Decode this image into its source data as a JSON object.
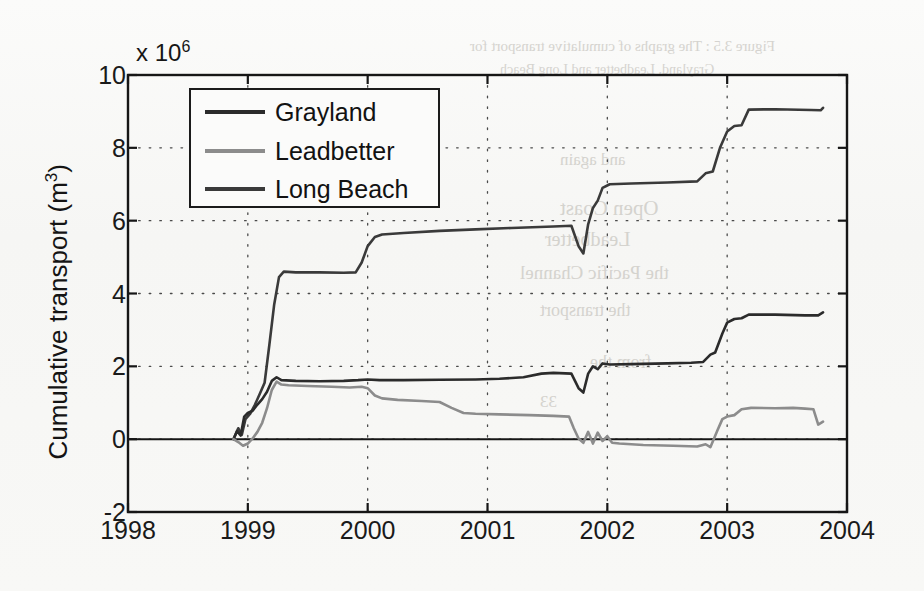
{
  "figure": {
    "exponent_label": "x 10",
    "exponent_sup": "6",
    "ylabel_text": "Cumulative transport (m",
    "ylabel_sup": "3",
    "ylabel_tail": ")"
  },
  "legend": {
    "items": [
      {
        "label": "Grayland",
        "color": "#2b2b2b"
      },
      {
        "label": "Leadbetter",
        "color": "#8c8c8c"
      },
      {
        "label": "Long Beach",
        "color": "#3a3a3a"
      }
    ]
  },
  "bleed_through": [
    {
      "text": "Figure 3.5 : The graphs of cumulative transport for",
      "x": 470,
      "y": 38,
      "size": 15
    },
    {
      "text": "Grayland, Leadbetter and Long Beach",
      "x": 500,
      "y": 62,
      "size": 14
    },
    {
      "text": "and again",
      "x": 560,
      "y": 150,
      "size": 17
    },
    {
      "text": "Open Coast",
      "x": 560,
      "y": 196,
      "size": 21
    },
    {
      "text": "Leadbetter",
      "x": 545,
      "y": 228,
      "size": 20
    },
    {
      "text": "the Pacific Channel",
      "x": 520,
      "y": 262,
      "size": 19
    },
    {
      "text": "the transport",
      "x": 540,
      "y": 300,
      "size": 18
    },
    {
      "text": "from the",
      "x": 590,
      "y": 352,
      "size": 18
    },
    {
      "text": "33",
      "x": 540,
      "y": 392,
      "size": 17
    }
  ],
  "chart_data": {
    "type": "line",
    "title": "",
    "xlabel": "",
    "ylabel": "Cumulative transport (m3)",
    "y_exponent": 1000000,
    "xlim": [
      1998,
      2004
    ],
    "ylim": [
      -2,
      10
    ],
    "xticks": [
      "1998",
      "1999",
      "2000",
      "2001",
      "2002",
      "2003",
      "2004"
    ],
    "yticks": [
      "10",
      "8",
      "6",
      "4",
      "2",
      "0",
      "-2"
    ],
    "grid": "dotted",
    "legend_position": "upper-left-inside",
    "units": "million cubic metres",
    "series": [
      {
        "name": "Long Beach",
        "color": "#3a3a3a",
        "points": [
          [
            1998.88,
            0.0
          ],
          [
            1998.92,
            0.3
          ],
          [
            1998.95,
            0.12
          ],
          [
            1998.98,
            0.55
          ],
          [
            1999.02,
            0.7
          ],
          [
            1999.06,
            0.95
          ],
          [
            1999.1,
            1.25
          ],
          [
            1999.14,
            1.55
          ],
          [
            1999.18,
            2.6
          ],
          [
            1999.22,
            3.7
          ],
          [
            1999.26,
            4.45
          ],
          [
            1999.3,
            4.6
          ],
          [
            1999.4,
            4.58
          ],
          [
            1999.6,
            4.58
          ],
          [
            1999.8,
            4.57
          ],
          [
            1999.9,
            4.58
          ],
          [
            1999.95,
            4.85
          ],
          [
            2000.0,
            5.3
          ],
          [
            2000.06,
            5.55
          ],
          [
            2000.12,
            5.62
          ],
          [
            2000.3,
            5.66
          ],
          [
            2000.6,
            5.72
          ],
          [
            2000.9,
            5.76
          ],
          [
            2001.2,
            5.8
          ],
          [
            2001.55,
            5.84
          ],
          [
            2001.7,
            5.86
          ],
          [
            2001.76,
            5.3
          ],
          [
            2001.8,
            5.1
          ],
          [
            2001.84,
            5.9
          ],
          [
            2001.88,
            6.35
          ],
          [
            2001.92,
            6.55
          ],
          [
            2001.96,
            6.9
          ],
          [
            2002.02,
            7.0
          ],
          [
            2002.2,
            7.02
          ],
          [
            2002.5,
            7.05
          ],
          [
            2002.75,
            7.08
          ],
          [
            2002.82,
            7.3
          ],
          [
            2002.88,
            7.35
          ],
          [
            2002.94,
            8.0
          ],
          [
            2003.0,
            8.45
          ],
          [
            2003.06,
            8.6
          ],
          [
            2003.12,
            8.62
          ],
          [
            2003.18,
            9.05
          ],
          [
            2003.4,
            9.06
          ],
          [
            2003.7,
            9.04
          ],
          [
            2003.78,
            9.03
          ],
          [
            2003.8,
            9.1
          ]
        ]
      },
      {
        "name": "Grayland",
        "color": "#2b2b2b",
        "points": [
          [
            1998.88,
            0.0
          ],
          [
            1998.91,
            0.22
          ],
          [
            1998.94,
            0.1
          ],
          [
            1998.97,
            0.62
          ],
          [
            1999.0,
            0.72
          ],
          [
            1999.04,
            0.78
          ],
          [
            1999.08,
            0.95
          ],
          [
            1999.12,
            1.1
          ],
          [
            1999.16,
            1.3
          ],
          [
            1999.2,
            1.6
          ],
          [
            1999.24,
            1.7
          ],
          [
            1999.28,
            1.62
          ],
          [
            1999.4,
            1.6
          ],
          [
            1999.6,
            1.59
          ],
          [
            1999.8,
            1.6
          ],
          [
            1999.92,
            1.62
          ],
          [
            2000.0,
            1.64
          ],
          [
            2000.1,
            1.62
          ],
          [
            2000.3,
            1.62
          ],
          [
            2000.6,
            1.63
          ],
          [
            2000.9,
            1.64
          ],
          [
            2001.1,
            1.66
          ],
          [
            2001.3,
            1.7
          ],
          [
            2001.45,
            1.8
          ],
          [
            2001.55,
            1.82
          ],
          [
            2001.7,
            1.8
          ],
          [
            2001.76,
            1.4
          ],
          [
            2001.8,
            1.28
          ],
          [
            2001.84,
            1.8
          ],
          [
            2001.88,
            2.0
          ],
          [
            2001.92,
            1.92
          ],
          [
            2001.96,
            2.08
          ],
          [
            2002.02,
            2.05
          ],
          [
            2002.2,
            2.06
          ],
          [
            2002.5,
            2.08
          ],
          [
            2002.7,
            2.1
          ],
          [
            2002.8,
            2.12
          ],
          [
            2002.86,
            2.32
          ],
          [
            2002.9,
            2.38
          ],
          [
            2002.96,
            2.9
          ],
          [
            2003.0,
            3.2
          ],
          [
            2003.06,
            3.3
          ],
          [
            2003.12,
            3.32
          ],
          [
            2003.18,
            3.42
          ],
          [
            2003.4,
            3.42
          ],
          [
            2003.65,
            3.4
          ],
          [
            2003.76,
            3.4
          ],
          [
            2003.8,
            3.48
          ]
        ]
      },
      {
        "name": "Leadbetter",
        "color": "#8c8c8c",
        "points": [
          [
            1998.88,
            0.0
          ],
          [
            1998.92,
            -0.08
          ],
          [
            1998.96,
            -0.18
          ],
          [
            1999.0,
            -0.12
          ],
          [
            1999.04,
            0.02
          ],
          [
            1999.08,
            0.2
          ],
          [
            1999.12,
            0.45
          ],
          [
            1999.16,
            0.85
          ],
          [
            1999.2,
            1.35
          ],
          [
            1999.24,
            1.58
          ],
          [
            1999.28,
            1.5
          ],
          [
            1999.34,
            1.48
          ],
          [
            1999.5,
            1.46
          ],
          [
            1999.7,
            1.44
          ],
          [
            1999.85,
            1.42
          ],
          [
            1999.95,
            1.44
          ],
          [
            2000.0,
            1.4
          ],
          [
            2000.06,
            1.2
          ],
          [
            2000.12,
            1.12
          ],
          [
            2000.25,
            1.08
          ],
          [
            2000.45,
            1.05
          ],
          [
            2000.6,
            1.02
          ],
          [
            2000.7,
            0.86
          ],
          [
            2000.8,
            0.72
          ],
          [
            2000.9,
            0.7
          ],
          [
            2001.1,
            0.68
          ],
          [
            2001.35,
            0.66
          ],
          [
            2001.55,
            0.64
          ],
          [
            2001.68,
            0.62
          ],
          [
            2001.72,
            0.3
          ],
          [
            2001.76,
            0.02
          ],
          [
            2001.8,
            -0.1
          ],
          [
            2001.84,
            0.2
          ],
          [
            2001.88,
            -0.12
          ],
          [
            2001.92,
            0.18
          ],
          [
            2001.96,
            -0.05
          ],
          [
            2002.0,
            0.08
          ],
          [
            2002.04,
            -0.1
          ],
          [
            2002.1,
            -0.12
          ],
          [
            2002.3,
            -0.16
          ],
          [
            2002.55,
            -0.18
          ],
          [
            2002.75,
            -0.2
          ],
          [
            2002.82,
            -0.14
          ],
          [
            2002.86,
            -0.22
          ],
          [
            2002.92,
            0.25
          ],
          [
            2002.96,
            0.55
          ],
          [
            2003.0,
            0.62
          ],
          [
            2003.06,
            0.66
          ],
          [
            2003.12,
            0.82
          ],
          [
            2003.2,
            0.86
          ],
          [
            2003.4,
            0.85
          ],
          [
            2003.55,
            0.86
          ],
          [
            2003.65,
            0.84
          ],
          [
            2003.72,
            0.82
          ],
          [
            2003.76,
            0.4
          ],
          [
            2003.8,
            0.48
          ]
        ]
      }
    ]
  }
}
